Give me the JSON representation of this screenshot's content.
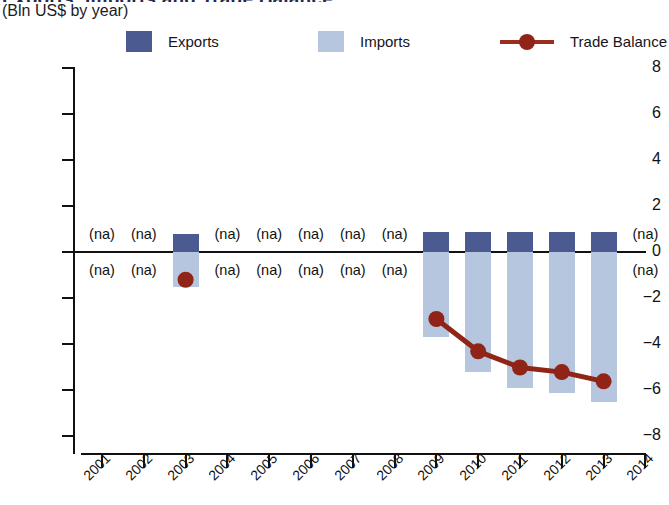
{
  "header": {
    "title_clipped": "Exports, Imports and Trade Balance",
    "subtitle": "(Bln US$ by year)"
  },
  "legend": {
    "items": [
      {
        "label": "Exports",
        "color": "#4c5a92",
        "marker": "square"
      },
      {
        "label": "Imports",
        "color": "#b6c6de",
        "marker": "square"
      },
      {
        "label": "Trade Balance",
        "color": "#8f2417",
        "marker": "line-dot"
      }
    ]
  },
  "axes": {
    "y_ticks": [
      "8",
      "6",
      "4",
      "2",
      "0",
      "−2",
      "−4",
      "−6",
      "−8"
    ],
    "x_ticks": [
      "2001",
      "2002",
      "2003",
      "2004",
      "2005",
      "2006",
      "2007",
      "2008",
      "2009",
      "2010",
      "2011",
      "2012",
      "2013",
      "2014"
    ]
  },
  "na_text": "(na)",
  "chart_data": {
    "type": "bar",
    "title": "Exports, Imports and Trade Balance",
    "subtitle": "(Bln US$ by year)",
    "xlabel": "",
    "ylabel": "Bln US$",
    "ylim": [
      -8,
      8
    ],
    "ytick_step": 2,
    "grid": false,
    "legend_position": "top",
    "categories": [
      "2001",
      "2002",
      "2003",
      "2004",
      "2005",
      "2006",
      "2007",
      "2008",
      "2009",
      "2010",
      "2011",
      "2012",
      "2013",
      "2014"
    ],
    "series": [
      {
        "name": "Exports",
        "type": "bar",
        "color": "#4c5a92",
        "values": [
          null,
          null,
          0.8,
          null,
          null,
          null,
          null,
          null,
          0.85,
          0.85,
          0.85,
          0.85,
          0.85,
          null
        ]
      },
      {
        "name": "Imports",
        "type": "bar",
        "color": "#b6c6de",
        "values": [
          null,
          null,
          -1.5,
          null,
          null,
          null,
          null,
          null,
          -3.7,
          -5.2,
          -5.9,
          -6.1,
          -6.5,
          null
        ]
      },
      {
        "name": "Trade Balance",
        "type": "line",
        "color": "#8f2417",
        "values": [
          null,
          null,
          -1.2,
          null,
          null,
          null,
          null,
          null,
          -2.9,
          -4.3,
          -5.0,
          -5.2,
          -5.6,
          null
        ]
      }
    ],
    "na_categories": [
      "2001",
      "2002",
      "2004",
      "2005",
      "2006",
      "2007",
      "2008",
      "2014"
    ],
    "na_label": "(na)"
  }
}
